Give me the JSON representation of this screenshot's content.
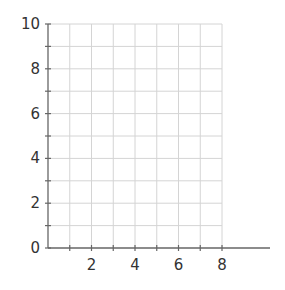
{
  "chart_data": {
    "type": "scatter",
    "title": "",
    "xlabel": "",
    "ylabel": "",
    "xlim": [
      0,
      8
    ],
    "ylim": [
      0,
      10
    ],
    "x_ticks": [
      2,
      4,
      6,
      8
    ],
    "y_ticks": [
      0,
      2,
      4,
      6,
      8,
      10
    ],
    "grid": true,
    "grid_step_x": 1,
    "grid_step_y": 1,
    "series": [],
    "colors": {
      "grid": "#d4d4d4",
      "axis": "#666666",
      "text": "#333333"
    }
  },
  "labels": {
    "x": [
      "2",
      "4",
      "6",
      "8"
    ],
    "y": [
      "0",
      "2",
      "4",
      "6",
      "8",
      "10"
    ]
  }
}
